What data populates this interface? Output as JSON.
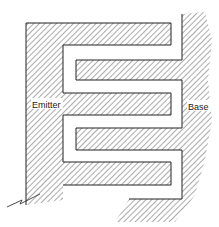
{
  "diagram": {
    "type": "interdigitated-transistor-layout",
    "labels": {
      "emitter": "Emitter",
      "base": "Base"
    },
    "colors": {
      "line": "#222222",
      "hatch": "#444444",
      "background": "#ffffff"
    }
  }
}
